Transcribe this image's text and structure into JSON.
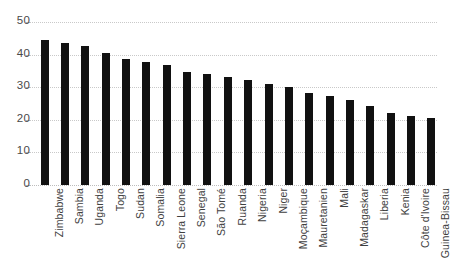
{
  "chart_data": {
    "type": "bar",
    "title": "",
    "subtitle": "",
    "xlabel": "",
    "ylabel": "",
    "ylim": [
      0,
      50
    ],
    "yticks": [
      0,
      10,
      20,
      30,
      40,
      50
    ],
    "grid": true,
    "legend": false,
    "legend_position": "none",
    "orientation": "vertical",
    "bar_color": "#111111",
    "gridline_color": "#c9c9c9",
    "background_color": "#ffffff",
    "label_rotation": 90,
    "categories": [
      "Zimbabwe",
      "Sambia",
      "Uganda",
      "Togo",
      "Sudan",
      "Somalia",
      "Sierra Leone",
      "Senegal",
      "São Tomé",
      "Ruanda",
      "Nigeria",
      "Niger",
      "Moçambique",
      "Mauretanien",
      "Mali",
      "Madagaskar",
      "Liberia",
      "Kenia",
      "Côte d'Ivoire",
      "Guinea-Bissau"
    ],
    "values": [
      44.5,
      43.5,
      42.5,
      40.5,
      38.8,
      37.7,
      36.8,
      34.8,
      33.9,
      33.0,
      32.1,
      31.1,
      30.2,
      28.2,
      27.2,
      26.2,
      24.2,
      22.2,
      21.3,
      20.4
    ]
  },
  "axes": {
    "y_tick_labels": [
      "0",
      "10",
      "20",
      "30",
      "40",
      "50"
    ]
  }
}
